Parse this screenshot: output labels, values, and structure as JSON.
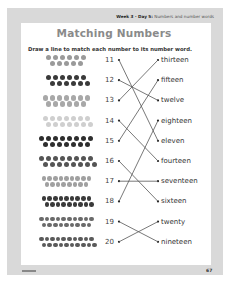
{
  "header": {
    "week_day": "Week 3 · Day 5:",
    "topic": "Numbers and number words"
  },
  "title": "Matching Numbers",
  "instruction": "Draw a line to match each number to its number word.",
  "numbers": [
    "11",
    "12",
    "13",
    "14",
    "15",
    "16",
    "17",
    "18",
    "19",
    "20"
  ],
  "words": [
    "thirteen",
    "fifteen",
    "twelve",
    "eighteen",
    "eleven",
    "fourteen",
    "seventeen",
    "sixteen",
    "twenty",
    "nineteen"
  ],
  "matches": [
    {
      "number": "11",
      "word": "eleven"
    },
    {
      "number": "12",
      "word": "twelve"
    },
    {
      "number": "13",
      "word": "thirteen"
    },
    {
      "number": "14",
      "word": "fourteen"
    },
    {
      "number": "15",
      "word": "fifteen"
    },
    {
      "number": "16",
      "word": "sixteen"
    },
    {
      "number": "17",
      "word": "seventeen"
    },
    {
      "number": "18",
      "word": "eighteen"
    },
    {
      "number": "19",
      "word": "nineteen"
    },
    {
      "number": "20",
      "word": "twenty"
    }
  ],
  "pictures": [
    {
      "count": 11,
      "icon": "clover-icon",
      "color": "#9a9a9a"
    },
    {
      "count": 12,
      "icon": "flower-icon",
      "color": "#3a3a3a"
    },
    {
      "count": 13,
      "icon": "daisy-icon",
      "color": "#a8a8a8"
    },
    {
      "count": 14,
      "icon": "circle-icon",
      "color": "#cfcfcf"
    },
    {
      "count": 15,
      "icon": "circle-icon",
      "color": "#2e2e2e"
    },
    {
      "count": 16,
      "icon": "circle-icon",
      "color": "#555555"
    },
    {
      "count": 17,
      "icon": "clover-icon",
      "color": "#a0a0a0"
    },
    {
      "count": 18,
      "icon": "circle-icon",
      "color": "#3a3a3a"
    },
    {
      "count": 19,
      "icon": "circle-icon",
      "color": "#6a6a6a"
    },
    {
      "count": 20,
      "icon": "circle-icon",
      "color": "#5a5a5a"
    }
  ],
  "footer": {
    "page_number": "67"
  }
}
